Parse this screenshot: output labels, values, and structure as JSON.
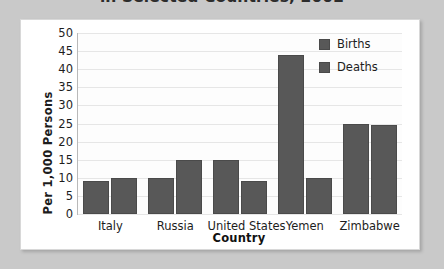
{
  "title": "in Selected Countries, 2002",
  "colors": {
    "page_background": "#c9c9c9",
    "card_background": "#ffffff",
    "bar": "#585858",
    "gridline": "#e6e6e6",
    "axis": "#b9b9b9"
  },
  "legend": {
    "position": "top-right",
    "items": [
      {
        "label": "Births",
        "color": "#585858"
      },
      {
        "label": "Deaths",
        "color": "#585858"
      }
    ]
  },
  "chart_data": {
    "type": "bar",
    "title": "in Selected Countries, 2002",
    "xlabel": "Country",
    "ylabel": "Per 1,000 Persons",
    "categories": [
      "Italy",
      "Russia",
      "United States",
      "Yemen",
      "Zimbabwe"
    ],
    "series": [
      {
        "name": "Births",
        "values": [
          9,
          10,
          15,
          44,
          25
        ]
      },
      {
        "name": "Deaths",
        "values": [
          10,
          15,
          9,
          10,
          24.5
        ]
      }
    ],
    "ylim": [
      0,
      50
    ],
    "yticks": [
      50,
      45,
      40,
      35,
      30,
      25,
      20,
      15,
      10,
      5,
      0
    ],
    "grid": true,
    "legend_position": "top-right"
  }
}
